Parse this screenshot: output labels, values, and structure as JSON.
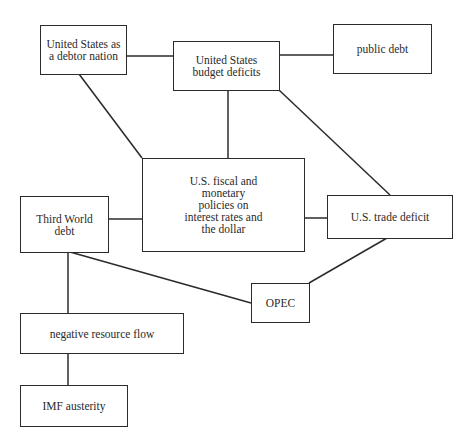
{
  "diagram": {
    "type": "concept-map",
    "nodes": [
      {
        "id": "debtor_nation",
        "label": "United States as\na debtor nation"
      },
      {
        "id": "budget_deficits",
        "label": "United States\nbudget deficits"
      },
      {
        "id": "public_debt",
        "label": "public debt"
      },
      {
        "id": "fiscal_policies",
        "label": "U.S. fiscal and\nmonetary\npolicies on\ninterest rates and\nthe dollar"
      },
      {
        "id": "third_world_debt",
        "label": "Third World\ndebt"
      },
      {
        "id": "trade_deficit",
        "label": "U.S. trade deficit"
      },
      {
        "id": "opec",
        "label": "OPEC"
      },
      {
        "id": "negative_flow",
        "label": "negative resource flow"
      },
      {
        "id": "imf_austerity",
        "label": "IMF austerity"
      }
    ],
    "edges": [
      [
        "debtor_nation",
        "budget_deficits"
      ],
      [
        "budget_deficits",
        "public_debt"
      ],
      [
        "debtor_nation",
        "fiscal_policies"
      ],
      [
        "budget_deficits",
        "fiscal_policies"
      ],
      [
        "budget_deficits",
        "trade_deficit"
      ],
      [
        "third_world_debt",
        "fiscal_policies"
      ],
      [
        "fiscal_policies",
        "trade_deficit"
      ],
      [
        "third_world_debt",
        "negative_flow"
      ],
      [
        "third_world_debt",
        "opec"
      ],
      [
        "trade_deficit",
        "opec"
      ],
      [
        "negative_flow",
        "imf_austerity"
      ]
    ]
  }
}
